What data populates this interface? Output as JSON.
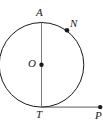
{
  "figure": {
    "width": 103,
    "height": 124,
    "background_color": "#ffffff",
    "stroke_color": "#1a1a1a",
    "label_color": "#1a1a1a",
    "stroke_width": 1,
    "circle": {
      "center_x": 41.5,
      "center_y": 64.8,
      "radius": 42.3
    },
    "points": [
      {
        "name": "A",
        "label": "A",
        "x": 41.5,
        "y": 22.5,
        "marker": false,
        "label_x": 36,
        "label_y": 7
      },
      {
        "name": "N",
        "label": "N",
        "x": 67.0,
        "y": 30.2,
        "marker": true,
        "label_x": 70,
        "label_y": 18
      },
      {
        "name": "O",
        "label": "O",
        "x": 41.5,
        "y": 64.8,
        "marker": true,
        "label_x": 28,
        "label_y": 58
      },
      {
        "name": "T",
        "label": "T",
        "x": 41.5,
        "y": 107.1,
        "marker": false,
        "label_x": 36,
        "label_y": 109
      },
      {
        "name": "P",
        "label": "P",
        "x": 100.0,
        "y": 107.1,
        "marker": true,
        "label_x": 95,
        "label_y": 110
      }
    ],
    "segments": [
      {
        "name": "diameter-AT",
        "x1": 41.5,
        "y1": 22.5,
        "x2": 41.5,
        "y2": 107.1
      },
      {
        "name": "tangent-TP",
        "x1": 41.5,
        "y1": 107.1,
        "x2": 101.0,
        "y2": 107.1
      }
    ],
    "marker_radius": 2.2
  }
}
